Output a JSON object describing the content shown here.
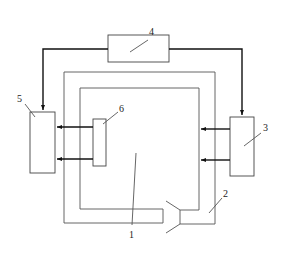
{
  "figure": {
    "type": "schematic",
    "colors": {
      "line": "#555555",
      "thick_line": "#111111",
      "background": "#ffffff"
    },
    "labels": {
      "l1": "1",
      "l2": "2",
      "l3": "3",
      "l4": "4",
      "l5": "5",
      "l6": "6"
    },
    "components": [
      {
        "id": "1",
        "role": "inner chamber / duct loop"
      },
      {
        "id": "2",
        "role": "inlet funnel duct"
      },
      {
        "id": "3",
        "role": "right unit"
      },
      {
        "id": "4",
        "role": "top unit"
      },
      {
        "id": "5",
        "role": "left unit"
      },
      {
        "id": "6",
        "role": "small inner unit"
      }
    ],
    "connections": [
      {
        "from": "4",
        "to": "5",
        "direction": "down-arrow"
      },
      {
        "from": "4",
        "to": "3",
        "direction": "down-arrow"
      },
      {
        "from": "6",
        "to": "5",
        "direction": "left-arrow",
        "count": 2
      },
      {
        "from": "3",
        "to": "1",
        "direction": "left-arrow",
        "count": 2
      }
    ]
  }
}
